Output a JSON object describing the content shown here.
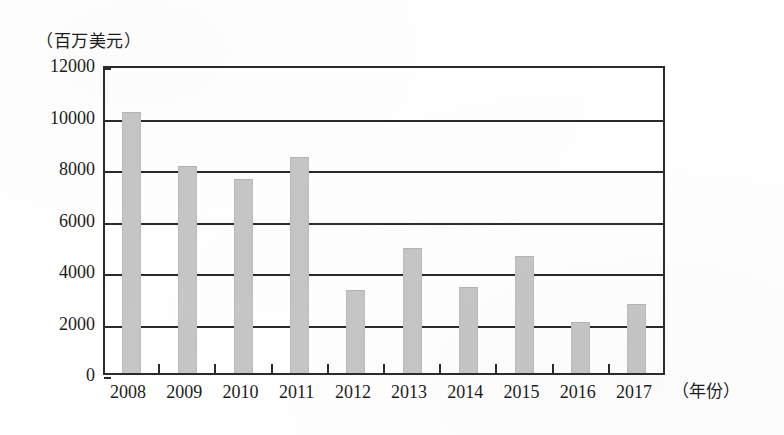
{
  "chart_data": {
    "type": "bar",
    "title": "",
    "subtitle": "",
    "xlabel": "（年份）",
    "ylabel": "（百万美元）",
    "categories": [
      "2008",
      "2009",
      "2010",
      "2011",
      "2012",
      "2013",
      "2014",
      "2015",
      "2016",
      "2017"
    ],
    "values": [
      10100,
      8000,
      7500,
      8350,
      3200,
      4800,
      3300,
      4500,
      1950,
      2650
    ],
    "series": [
      {
        "name": "",
        "values": [
          10100,
          8000,
          7500,
          8350,
          3200,
          4800,
          3300,
          4500,
          1950,
          2650
        ]
      }
    ],
    "ylim": [
      0,
      12000
    ],
    "ytick_labels": [
      "0",
      "2000",
      "4000",
      "6000",
      "8000",
      "10000",
      "12000"
    ],
    "ytick_values": [
      0,
      2000,
      4000,
      6000,
      8000,
      10000,
      12000
    ],
    "grid": true,
    "grid_axis": "y",
    "legend": false,
    "legend_position": "none",
    "bar_color": "#c6c6c6",
    "axis_color": "#2b2b2b",
    "background_color": "#ffffff"
  },
  "axes": {
    "y_unit_caption": "（百万美元）",
    "x_unit_caption": "（年份）"
  }
}
